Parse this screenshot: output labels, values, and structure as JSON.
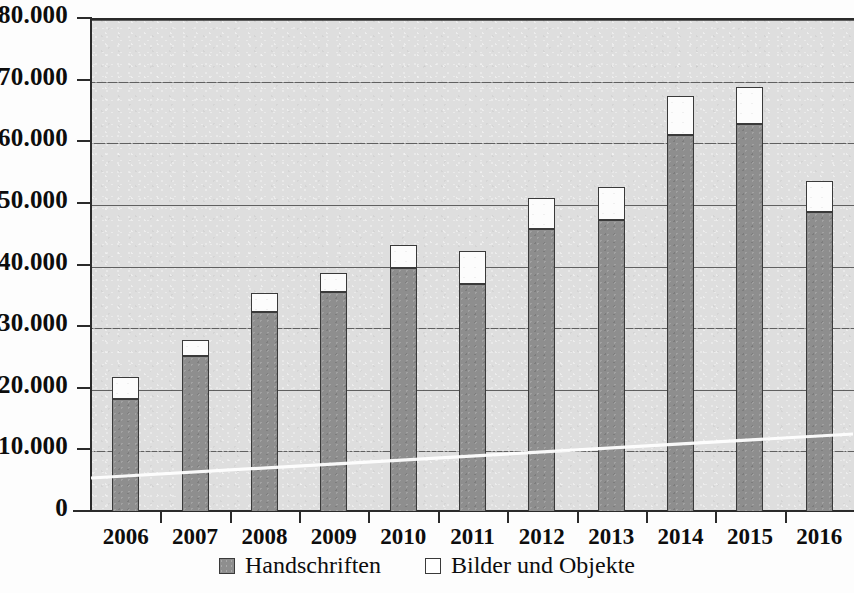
{
  "chart_data": {
    "type": "bar",
    "subtype": "stacked",
    "title": "",
    "xlabel": "",
    "ylabel": "",
    "categories": [
      "2006",
      "2007",
      "2008",
      "2009",
      "2010",
      "2011",
      "2012",
      "2013",
      "2014",
      "2015",
      "2016"
    ],
    "series": [
      {
        "name": "Handschriften",
        "color": "#8e8e8e",
        "values": [
          18100,
          25100,
          32300,
          35500,
          39500,
          36900,
          45800,
          47300,
          61000,
          62800,
          48500
        ]
      },
      {
        "name": "Bilder und Objekte",
        "color": "#ffffff",
        "values": [
          3700,
          2700,
          3000,
          3100,
          3600,
          5300,
          5000,
          5200,
          6400,
          6000,
          5100
        ]
      }
    ],
    "totals": [
      21800,
      27800,
      35300,
      38600,
      43100,
      42200,
      50800,
      52500,
      67400,
      68800,
      53600
    ],
    "ylim": [
      0,
      80000
    ],
    "ytick_values": [
      0,
      10000,
      20000,
      30000,
      40000,
      50000,
      60000,
      70000,
      80000
    ],
    "ytick_labels": [
      "0",
      "10.000",
      "20.000",
      "30.000",
      "40.000",
      "50.000",
      "60.000",
      "70.000",
      "80.000"
    ],
    "grid": true,
    "grid_axis": "y",
    "legend_position": "bottom-center",
    "plot_background": "#dedede",
    "annotations": []
  },
  "legend": {
    "entries": [
      {
        "label": "Handschriften",
        "swatch": "gray-square-icon"
      },
      {
        "label": "Bilder und Objekte",
        "swatch": "white-square-icon"
      }
    ]
  }
}
